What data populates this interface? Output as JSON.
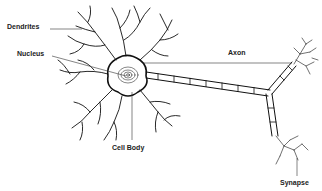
{
  "diagram": {
    "labels": {
      "dendrites": "Dendrites",
      "nucleus": "Nucleus",
      "axon": "Axon",
      "cell_body": "Cell Body",
      "synapse": "Synapse"
    },
    "colors": {
      "stroke": "#111111",
      "leader": "#333333",
      "text": "#222222",
      "background": "#ffffff"
    }
  }
}
